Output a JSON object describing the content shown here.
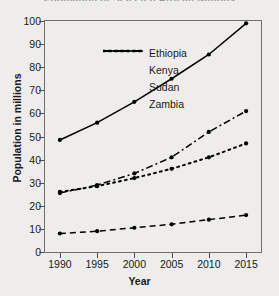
{
  "chart_data": {
    "type": "line",
    "title": "Population of Selected African Nations",
    "xlabel": "Year",
    "ylabel": "Population in millions",
    "x": [
      1990,
      1995,
      2000,
      2005,
      2010,
      2015
    ],
    "xtick_labels": [
      "1990",
      "1995",
      "2000",
      "2005",
      "2010",
      "2015"
    ],
    "ytick_labels": [
      "0",
      "10",
      "20",
      "30",
      "40",
      "50",
      "60",
      "70",
      "80",
      "90",
      "100"
    ],
    "yticks": [
      0,
      10,
      20,
      30,
      40,
      50,
      60,
      70,
      80,
      90,
      100
    ],
    "xlim": [
      1988,
      2017
    ],
    "ylim": [
      0,
      100
    ],
    "grid": false,
    "legend_position": "upper-left-inside",
    "series": [
      {
        "name": "Ethiopia",
        "style": "solid",
        "dasharray": "",
        "values": [
          48.5,
          56,
          65,
          75,
          85.5,
          99
        ]
      },
      {
        "name": "Kenya",
        "style": "dash-dot",
        "dasharray": "7,3,2,3",
        "values": [
          25.5,
          29,
          34,
          41,
          52,
          61
        ]
      },
      {
        "name": "Sudan",
        "style": "dotted",
        "dasharray": "2,4",
        "values": [
          26,
          28.5,
          32,
          36,
          41,
          47
        ]
      },
      {
        "name": "Zambia",
        "style": "dashed",
        "dasharray": "6,4",
        "values": [
          8,
          9,
          10.5,
          12,
          14,
          16
        ]
      }
    ],
    "colors": {
      "line": "#000000",
      "marker": "#000000",
      "background": "#eeedeb",
      "axis": "#6f6f6f",
      "text": "#1a1a1a"
    }
  }
}
